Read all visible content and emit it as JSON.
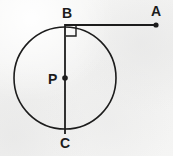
{
  "figure": {
    "type": "geometry-diagram",
    "background_color": "#f3f3f2",
    "stroke_color": "#1c1c1c",
    "circle": {
      "name": "circle-P",
      "center_x": 65,
      "center_y": 78,
      "radius": 51,
      "stroke_width": 1.6
    },
    "points": [
      {
        "id": "A",
        "label": "A",
        "x": 156,
        "y": 25,
        "dot": true,
        "label_x": 151,
        "label_y": 4
      },
      {
        "id": "B",
        "label": "B",
        "x": 65,
        "y": 25,
        "dot": false,
        "label_x": 62,
        "label_y": 6
      },
      {
        "id": "P",
        "label": "P",
        "x": 65,
        "y": 78,
        "dot": true,
        "label_x": 48,
        "label_y": 72
      },
      {
        "id": "C",
        "label": "C",
        "x": 65,
        "y": 134,
        "dot": false,
        "label_x": 60,
        "label_y": 136
      }
    ],
    "segments": [
      {
        "id": "BA",
        "label": "tangent-line-BA",
        "x1": 65,
        "y1": 25,
        "x2": 156,
        "y2": 25,
        "stroke_width": 1.8
      },
      {
        "id": "BC",
        "label": "diameter-BC",
        "x1": 65,
        "y1": 24,
        "x2": 65,
        "y2": 134,
        "stroke_width": 1.8
      }
    ],
    "right_angle": {
      "id": "right-angle-B",
      "label": "right-angle-marker",
      "x": 66,
      "y": 26,
      "size": 10,
      "stroke_width": 1.4
    },
    "dot_radius": 2.6
  }
}
